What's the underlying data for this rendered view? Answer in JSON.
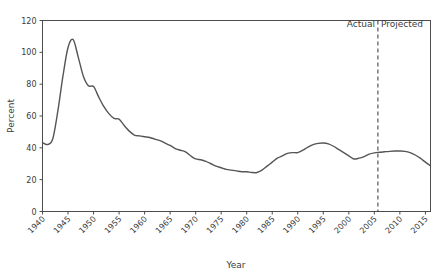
{
  "chart_data": {
    "type": "line",
    "title": "",
    "subtitle": "",
    "xlabel": "Year",
    "ylabel": "Percent",
    "xlim": [
      1940,
      2016
    ],
    "ylim": [
      0,
      120
    ],
    "xticks": [
      1940,
      1945,
      1950,
      1955,
      1960,
      1965,
      1970,
      1975,
      1980,
      1985,
      1990,
      1995,
      2000,
      2005,
      2010,
      2015
    ],
    "xtick_labels": [
      "1940",
      "1945",
      "1950",
      "1955",
      "1960",
      "1965",
      "1970",
      "1975",
      "1980",
      "1985",
      "1990",
      "1995",
      "2000",
      "2005",
      "2010",
      "2015"
    ],
    "yticks": [
      0,
      20,
      40,
      60,
      80,
      100,
      120
    ],
    "ytick_labels": [
      "0",
      "20",
      "40",
      "60",
      "80",
      "100",
      "120"
    ],
    "grid": false,
    "legend": "none",
    "line_color": "#555555",
    "line_width": 1.4,
    "series": [
      {
        "name": "Percent",
        "x": [
          1940,
          1941,
          1942,
          1943,
          1944,
          1945,
          1946,
          1947,
          1948,
          1949,
          1950,
          1951,
          1952,
          1953,
          1954,
          1955,
          1956,
          1957,
          1958,
          1959,
          1960,
          1961,
          1962,
          1963,
          1964,
          1965,
          1966,
          1967,
          1968,
          1969,
          1970,
          1971,
          1972,
          1973,
          1974,
          1975,
          1976,
          1977,
          1978,
          1979,
          1980,
          1981,
          1982,
          1983,
          1984,
          1985,
          1986,
          1987,
          1988,
          1989,
          1990,
          1991,
          1992,
          1993,
          1994,
          1995,
          1996,
          1997,
          1998,
          1999,
          2000,
          2001,
          2002,
          2003,
          2004,
          2005,
          2006,
          2007,
          2008,
          2009,
          2010,
          2011,
          2012,
          2013,
          2014,
          2015,
          2016
        ],
        "y": [
          43.3,
          42.1,
          45.5,
          63.0,
          85.0,
          103.0,
          108.0,
          97.0,
          85.0,
          79.0,
          78.5,
          72.0,
          66.0,
          61.5,
          58.5,
          58.0,
          54.0,
          50.5,
          48.0,
          47.5,
          47.0,
          46.5,
          45.5,
          44.5,
          43.0,
          41.5,
          39.5,
          38.5,
          37.5,
          35.0,
          33.0,
          32.5,
          31.5,
          30.0,
          28.5,
          27.5,
          26.5,
          26.0,
          25.5,
          25.0,
          25.0,
          24.5,
          24.5,
          26.0,
          28.5,
          31.0,
          33.5,
          35.0,
          36.5,
          37.0,
          37.0,
          38.5,
          40.5,
          42.0,
          42.8,
          43.0,
          42.5,
          41.0,
          39.0,
          37.0,
          35.0,
          33.0,
          33.5,
          34.5,
          36.0,
          36.8,
          37.2,
          37.5,
          37.8,
          38.0,
          38.0,
          37.8,
          37.0,
          35.5,
          33.5,
          31.0,
          28.8
        ]
      }
    ],
    "annotations": [
      {
        "name": "actual-label",
        "text": "Actual",
        "x": 2005,
        "y": 116,
        "align": "right"
      },
      {
        "name": "projected-label",
        "text": "Projected",
        "x": 2006,
        "y": 116,
        "align": "left"
      },
      {
        "name": "divider-line",
        "type": "vline",
        "x": 2005.7,
        "style": "dashed",
        "color": "#333333"
      }
    ]
  }
}
